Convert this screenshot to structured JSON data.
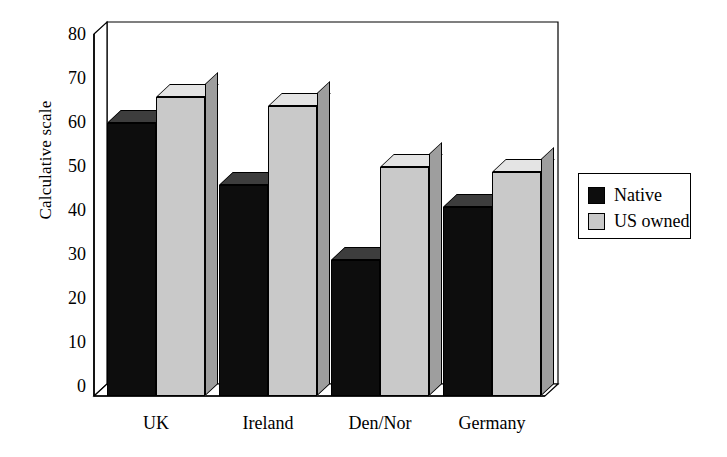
{
  "chart_data": {
    "type": "bar",
    "title": "",
    "subtitle": "",
    "xlabel": "",
    "ylabel": "Calculative scale",
    "categories": [
      "UK",
      "Ireland",
      "Den/Nor",
      "Germany"
    ],
    "series": [
      {
        "name": "Native",
        "color": "#0d0d0d",
        "values": [
          62,
          48,
          31,
          43
        ]
      },
      {
        "name": "US owned",
        "color": "#c9c9c9",
        "values": [
          68,
          66,
          52,
          51
        ]
      }
    ],
    "ylim": [
      0,
      80
    ],
    "ytick_values": [
      0,
      10,
      20,
      30,
      40,
      50,
      60,
      70,
      80
    ],
    "ytick_labels": [
      "0",
      "10",
      "20",
      "30",
      "40",
      "50",
      "60",
      "70",
      "80"
    ],
    "grid": false,
    "legend_position": "right",
    "style": "3d-bar",
    "annotations": []
  },
  "legend": {
    "entries": [
      {
        "label": "Native",
        "swatch": "#0d0d0d"
      },
      {
        "label": "US owned",
        "swatch": "#c9c9c9"
      }
    ]
  }
}
